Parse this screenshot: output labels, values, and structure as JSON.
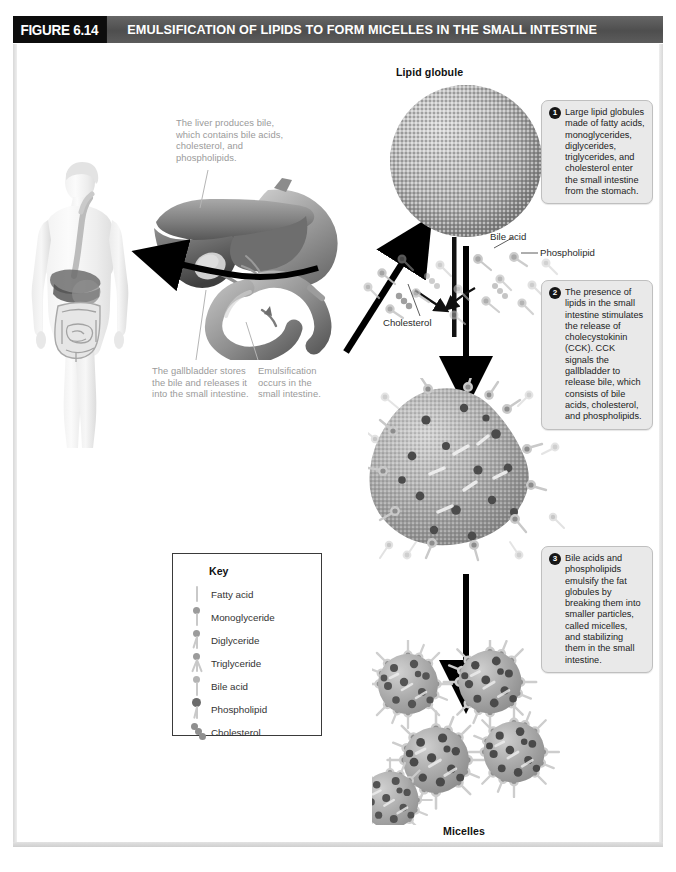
{
  "figure": {
    "number": "FIGURE 6.14",
    "title": "EMULSIFICATION OF LIPIDS TO FORM MICELLES IN THE SMALL INTESTINE",
    "header_bg": "#5a5a5a",
    "number_bg": "#0d0d0d"
  },
  "labels": {
    "liver_note": "The liver produces bile, which contains bile acids, cholesterol, and phospholipids.",
    "gallbladder_note": "The gallbladder stores the bile and releases it into the small intestine.",
    "emulsification_note": "Emulsification occurs in the small intestine.",
    "lipid_globule": "Lipid globule",
    "bile_acid": "Bile acid",
    "phospholipid": "Phospholipid",
    "cholesterol": "Cholesterol",
    "micelles": "Micelles"
  },
  "key": {
    "title": "Key",
    "items": [
      {
        "label": "Fatty acid",
        "icon": "fatty-acid-icon"
      },
      {
        "label": "Monoglyceride",
        "icon": "monoglyceride-icon"
      },
      {
        "label": "Diglyceride",
        "icon": "diglyceride-icon"
      },
      {
        "label": "Triglyceride",
        "icon": "triglyceride-icon"
      },
      {
        "label": "Bile acid",
        "icon": "bile-acid-icon"
      },
      {
        "label": "Phospholipid",
        "icon": "phospholipid-icon"
      },
      {
        "label": "Cholesterol",
        "icon": "cholesterol-icon"
      }
    ]
  },
  "callouts": [
    {
      "number": "1",
      "text": "Large lipid globules made of fatty acids, monoglycerides, diglycerides, triglycerides, and cholesterol enter the small intestine from the stomach."
    },
    {
      "number": "2",
      "text": "The presence of lipids in the small intestine stimulates the release of cholecystokinin (CCK). CCK signals the gallbladder to release bile, which consists of bile acids, cholesterol, and phospholipids."
    },
    {
      "number": "3",
      "text": "Bile acids and phospholipids emulsify the fat globules by breaking them into smaller particles, called micelles, and stabilizing them in the small intestine."
    }
  ],
  "colors": {
    "header_text": "#ffffff",
    "note_text": "#9a9a9a",
    "callout_bg": "#e9e9e9",
    "callout_border": "#bfbfbf",
    "key_border": "#3a3a3a",
    "molecule": "#9b9b9b"
  }
}
